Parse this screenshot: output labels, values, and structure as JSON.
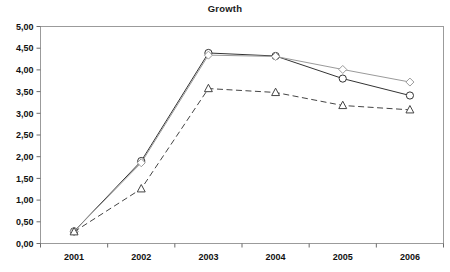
{
  "chart_data": {
    "type": "line",
    "title": "Growth",
    "xlabel": "",
    "ylabel": "",
    "categories": [
      "2001",
      "2002",
      "2003",
      "2004",
      "2005",
      "2006"
    ],
    "ylim": [
      0,
      5
    ],
    "ytick_values": [
      0,
      0.5,
      1,
      1.5,
      2,
      2.5,
      3,
      3.5,
      4,
      4.5,
      5
    ],
    "ytick_labels": [
      "0,00",
      "0,50",
      "1,00",
      "1,50",
      "2,00",
      "2,50",
      "3,00",
      "3,50",
      "4,00",
      "4,50",
      "5,00"
    ],
    "decimal_separator": ",",
    "grid": false,
    "legend": "none",
    "series": [
      {
        "name": "series-circle",
        "marker": "circle",
        "linestyle": "solid",
        "color": "#333333",
        "values": [
          0.28,
          1.9,
          4.39,
          4.32,
          3.8,
          3.41
        ]
      },
      {
        "name": "series-diamond",
        "marker": "diamond",
        "linestyle": "solid",
        "color": "#9a9a9a",
        "values": [
          0.28,
          1.86,
          4.34,
          4.31,
          4.01,
          3.72
        ]
      },
      {
        "name": "series-triangle",
        "marker": "triangle",
        "linestyle": "dashed",
        "color": "#444444",
        "values": [
          0.27,
          1.26,
          3.57,
          3.48,
          3.18,
          3.08
        ]
      }
    ]
  },
  "axes": {
    "frame_color": "#9b9b9b",
    "tick_color": "#6b6b6b"
  }
}
